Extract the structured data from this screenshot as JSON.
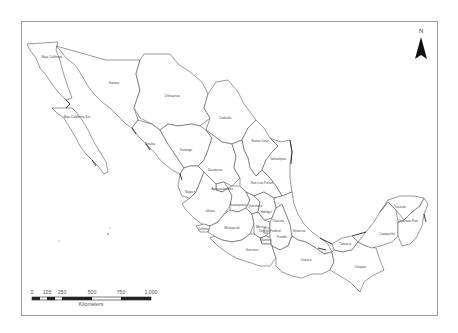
{
  "map": {
    "title": "",
    "country": "Mexico",
    "colors": {
      "frame": "#9a9a9a",
      "border": "#555555",
      "fill": "#ffffff",
      "scale_dark": "#222222"
    },
    "north_arrow": {
      "label": "N"
    },
    "scale_bar": {
      "ticks": [
        "0",
        "125",
        "250",
        "500",
        "750",
        "1,000"
      ],
      "unit": "Kilometers"
    },
    "states": [
      {
        "name": "Baja California",
        "x": 52,
        "y": 57
      },
      {
        "name": "Sonora",
        "x": 114,
        "y": 83
      },
      {
        "name": "Chihuahua",
        "x": 174,
        "y": 96
      },
      {
        "name": "Baja California Sur",
        "x": 77,
        "y": 117
      },
      {
        "name": "Coahuila",
        "x": 225,
        "y": 118
      },
      {
        "name": "Nuevo León",
        "x": 260,
        "y": 140
      },
      {
        "name": "Sinaloa",
        "x": 150,
        "y": 144
      },
      {
        "name": "Durango",
        "x": 186,
        "y": 150
      },
      {
        "name": "Tamaulipas",
        "x": 275,
        "y": 158
      },
      {
        "name": "Zacatecas",
        "x": 214,
        "y": 170
      },
      {
        "name": "San Luis Potosí",
        "x": 263,
        "y": 183
      },
      {
        "name": "Nayarit",
        "x": 190,
        "y": 192
      },
      {
        "name": "Aguascalientes",
        "x": 222,
        "y": 189
      },
      {
        "name": "Guanajuato",
        "x": 240,
        "y": 208
      },
      {
        "name": "Querétaro",
        "x": 258,
        "y": 209
      },
      {
        "name": "Jalisco",
        "x": 211,
        "y": 211
      },
      {
        "name": "Hidalgo",
        "x": 268,
        "y": 214
      },
      {
        "name": "Colima",
        "x": 203,
        "y": 230
      },
      {
        "name": "Michoacán",
        "x": 233,
        "y": 229
      },
      {
        "name": "México",
        "x": 262,
        "y": 228
      },
      {
        "name": "Tlaxcala",
        "x": 279,
        "y": 226
      },
      {
        "name": "Distrito Federal",
        "x": 268,
        "y": 235
      },
      {
        "name": "Morelos",
        "x": 266,
        "y": 238
      },
      {
        "name": "Puebla",
        "x": 282,
        "y": 238
      },
      {
        "name": "Veracruz",
        "x": 299,
        "y": 232
      },
      {
        "name": "Guerrero",
        "x": 252,
        "y": 250
      },
      {
        "name": "Oaxaca",
        "x": 307,
        "y": 260
      },
      {
        "name": "Tabasco",
        "x": 345,
        "y": 243
      },
      {
        "name": "Chiapas",
        "x": 360,
        "y": 267
      },
      {
        "name": "Campeche",
        "x": 387,
        "y": 235
      },
      {
        "name": "Yucatán",
        "x": 401,
        "y": 208
      },
      {
        "name": "Quintana Roo",
        "x": 406,
        "y": 222
      }
    ]
  }
}
